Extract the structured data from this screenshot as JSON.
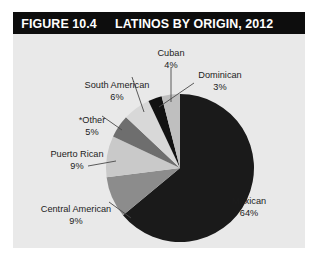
{
  "figure": {
    "number": "FIGURE 10.4",
    "title": "LATINOS BY ORIGIN, 2012"
  },
  "colors": {
    "title_bar_background": "#0d0d0d",
    "title_text": "#ffffff",
    "panel_background": "#e9e9e9",
    "page_background": "#ffffff",
    "label_text": "#1c1c1c",
    "leader_line": "#4a4a4a"
  },
  "chart_data": {
    "type": "pie",
    "title": "LATINOS BY ORIGIN, 2012",
    "subtitle": "",
    "xlabel": "",
    "ylabel": "",
    "legend_position": "none",
    "labels_position": "outside-with-leader-lines",
    "units": "percent",
    "categories": [
      "Mexican",
      "Central American",
      "Puerto Rican",
      "*Other",
      "South American",
      "Dominican",
      "Cuban"
    ],
    "values": [
      64,
      9,
      9,
      5,
      6,
      3,
      4
    ],
    "slices": [
      {
        "name": "Mexican",
        "value": 64,
        "value_text": "64%",
        "color": "#1a1a1a"
      },
      {
        "name": "Central American",
        "value": 9,
        "value_text": "9%",
        "color": "#8c8c8c"
      },
      {
        "name": "Puerto Rican",
        "value": 9,
        "value_text": "9%",
        "color": "#c9c9c9"
      },
      {
        "name": "*Other",
        "value": 5,
        "value_text": "5%",
        "color": "#6e6e6e"
      },
      {
        "name": "South American",
        "value": 6,
        "value_text": "6%",
        "color": "#d8d8d8"
      },
      {
        "name": "Dominican",
        "value": 3,
        "value_text": "3%",
        "color": "#121212"
      },
      {
        "name": "Cuban",
        "value": 4,
        "value_text": "4%",
        "color": "#bfbfbf"
      }
    ]
  },
  "labels": {
    "cuban": {
      "name": "Cuban",
      "pct": "4%"
    },
    "dominican": {
      "name": "Dominican",
      "pct": "3%"
    },
    "south_american": {
      "name": "South American",
      "pct": "6%"
    },
    "other": {
      "name": "*Other",
      "pct": "5%"
    },
    "puerto_rican": {
      "name": "Puerto Rican",
      "pct": "9%"
    },
    "central_american": {
      "name": "Central American",
      "pct": "9%"
    },
    "mexican": {
      "name": "Mexican",
      "pct": "64%"
    }
  }
}
